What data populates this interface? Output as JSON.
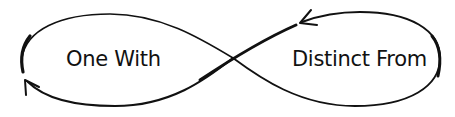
{
  "diagram": {
    "type": "infinity-loop",
    "labels": {
      "left": "One With",
      "right": "Distinct From"
    },
    "arrows": [
      {
        "name": "upper-right-arrow",
        "direction": "leftward",
        "position": "top of right loop"
      },
      {
        "name": "lower-left-arrow",
        "direction": "upward",
        "position": "bottom of left loop"
      }
    ],
    "colors": {
      "stroke": "#111111",
      "background": "#ffffff"
    }
  }
}
